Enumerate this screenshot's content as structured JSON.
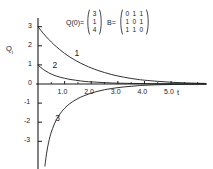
{
  "chart_data": {
    "type": "line",
    "title": "",
    "xlabel": "t",
    "ylabel": "Q_i",
    "xlim": [
      -0.15,
      6.35
    ],
    "ylim": [
      -4.3,
      3.35
    ],
    "grid": false,
    "legend": "inline-curve-labels",
    "x_ticks_major": [
      1.0,
      2.0,
      3.0,
      4.0,
      5.0
    ],
    "x_tick_labels": [
      "1.0",
      "2.0",
      "3.0",
      "4.0",
      "5.0"
    ],
    "x_ticks_minor": [
      0.5,
      1.5,
      2.5,
      3.5,
      4.5,
      5.5,
      6.0
    ],
    "y_ticks": [
      3,
      2,
      1,
      0,
      -1,
      -2,
      -3
    ],
    "y_tick_labels": [
      "3",
      "2",
      "1",
      "0",
      "-1",
      "-2",
      "-3"
    ],
    "series": [
      {
        "name": "1",
        "label": "1",
        "initial_value": 3,
        "label_position": {
          "x": 1.45,
          "y": 1.62
        },
        "points": [
          [
            0.0,
            3.0
          ],
          [
            0.1,
            2.82
          ],
          [
            0.2,
            2.65
          ],
          [
            0.3,
            2.49
          ],
          [
            0.4,
            2.34
          ],
          [
            0.5,
            2.2
          ],
          [
            0.6,
            2.06
          ],
          [
            0.7,
            1.94
          ],
          [
            0.8,
            1.82
          ],
          [
            0.9,
            1.71
          ],
          [
            1.0,
            1.6
          ],
          [
            1.2,
            1.41
          ],
          [
            1.4,
            1.24
          ],
          [
            1.6,
            1.09
          ],
          [
            1.8,
            0.96
          ],
          [
            2.0,
            0.84
          ],
          [
            2.25,
            0.71
          ],
          [
            2.5,
            0.6
          ],
          [
            2.75,
            0.5
          ],
          [
            3.0,
            0.42
          ],
          [
            3.25,
            0.35
          ],
          [
            3.5,
            0.29
          ],
          [
            3.75,
            0.24
          ],
          [
            4.0,
            0.2
          ],
          [
            4.5,
            0.14
          ],
          [
            5.0,
            0.09
          ],
          [
            5.5,
            0.06
          ],
          [
            6.0,
            0.04
          ],
          [
            6.3,
            0.03
          ]
        ]
      },
      {
        "name": "2",
        "label": "2",
        "initial_value": 1,
        "label_position": {
          "x": 0.62,
          "y": 1.02
        },
        "points": [
          [
            0.0,
            1.0
          ],
          [
            0.1,
            0.87
          ],
          [
            0.2,
            0.76
          ],
          [
            0.3,
            0.67
          ],
          [
            0.4,
            0.59
          ],
          [
            0.5,
            0.52
          ],
          [
            0.6,
            0.46
          ],
          [
            0.7,
            0.41
          ],
          [
            0.8,
            0.37
          ],
          [
            0.9,
            0.33
          ],
          [
            1.0,
            0.3
          ],
          [
            1.2,
            0.24
          ],
          [
            1.4,
            0.2
          ],
          [
            1.6,
            0.16
          ],
          [
            1.8,
            0.13
          ],
          [
            2.0,
            0.11
          ],
          [
            2.25,
            0.09
          ],
          [
            2.5,
            0.07
          ],
          [
            2.75,
            0.055
          ],
          [
            3.0,
            0.045
          ],
          [
            3.5,
            0.03
          ],
          [
            4.0,
            0.02
          ],
          [
            4.5,
            0.012
          ],
          [
            5.0,
            0.008
          ],
          [
            5.5,
            0.005
          ],
          [
            6.0,
            0.003
          ],
          [
            6.3,
            0.002
          ]
        ]
      },
      {
        "name": "3",
        "label": "3",
        "initial_value": -4.3,
        "label_position": {
          "x": 0.72,
          "y": -1.78
        },
        "points": [
          [
            0.26,
            -4.3
          ],
          [
            0.3,
            -3.85
          ],
          [
            0.35,
            -3.4
          ],
          [
            0.4,
            -3.05
          ],
          [
            0.45,
            -2.76
          ],
          [
            0.5,
            -2.52
          ],
          [
            0.6,
            -2.14
          ],
          [
            0.7,
            -1.85
          ],
          [
            0.8,
            -1.62
          ],
          [
            0.9,
            -1.43
          ],
          [
            1.0,
            -1.27
          ],
          [
            1.2,
            -1.02
          ],
          [
            1.4,
            -0.84
          ],
          [
            1.6,
            -0.69
          ],
          [
            1.8,
            -0.58
          ],
          [
            2.0,
            -0.48
          ],
          [
            2.25,
            -0.38
          ],
          [
            2.5,
            -0.3
          ],
          [
            2.75,
            -0.24
          ],
          [
            3.0,
            -0.19
          ],
          [
            3.25,
            -0.15
          ],
          [
            3.5,
            -0.12
          ],
          [
            3.75,
            -0.09
          ],
          [
            4.0,
            -0.07
          ],
          [
            4.5,
            -0.04
          ],
          [
            5.0,
            -0.025
          ],
          [
            5.5,
            -0.015
          ],
          [
            6.0,
            -0.01
          ],
          [
            6.3,
            -0.008
          ]
        ]
      }
    ]
  },
  "annotation": {
    "q_label": "Q(0)=",
    "q_vector": [
      [
        "3"
      ],
      [
        "1"
      ],
      [
        "4"
      ]
    ],
    "b_label": "B=",
    "b_matrix": [
      [
        "0",
        "1",
        "1"
      ],
      [
        "1",
        "0",
        "1"
      ],
      [
        "1",
        "1",
        "0"
      ]
    ]
  },
  "axes": {
    "y_axis_label": "Q",
    "y_axis_subscript": "i",
    "x_axis_label": "t"
  },
  "colors": {
    "curve": "#1a1a1a",
    "axis": "#1a1a1a",
    "text": "#1a1a1a",
    "background": "#ffffff"
  }
}
